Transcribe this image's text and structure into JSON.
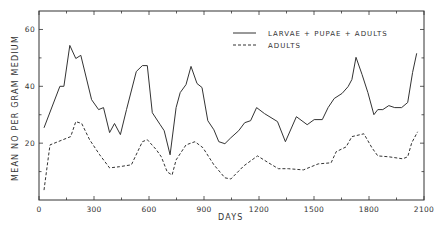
{
  "chart_data": {
    "type": "line",
    "title": "",
    "xlabel": "DAYS",
    "ylabel": "MEAN NO PER GRAM MEDIUM",
    "xlim": [
      0,
      2100
    ],
    "ylim": [
      0,
      66.5
    ],
    "xticks": [
      0,
      300,
      600,
      900,
      1200,
      1500,
      1800,
      2100
    ],
    "xtick_labels": [
      "0",
      "300",
      "600",
      "900",
      "1200",
      "1500",
      "1800",
      "2100"
    ],
    "xminor_step": 150,
    "yticks": [
      20,
      40,
      60
    ],
    "ytick_labels": [
      "20",
      "40",
      "60"
    ],
    "yminor_step": 10,
    "grid": false,
    "legend_position": "upper right",
    "series": [
      {
        "name": "LARVAE + PUPAE + ADULTS",
        "style": "solid",
        "color": "#333333",
        "x": [
          27,
          114,
          136,
          168,
          201,
          228,
          287,
          325,
          352,
          385,
          412,
          444,
          477,
          531,
          564,
          591,
          618,
          661,
          683,
          715,
          748,
          770,
          802,
          829,
          862,
          889,
          921,
          954,
          981,
          1014,
          1046,
          1089,
          1122,
          1154,
          1187,
          1230,
          1301,
          1344,
          1404,
          1463,
          1501,
          1545,
          1577,
          1610,
          1653,
          1686,
          1707,
          1729,
          1762,
          1794,
          1827,
          1848,
          1875,
          1908,
          1940,
          1978,
          2011,
          2038,
          2060
        ],
        "values": [
          25.4,
          40,
          40,
          54.4,
          49.8,
          50.9,
          35.3,
          31.8,
          32.5,
          23.7,
          26.9,
          23,
          31.8,
          45.2,
          47.3,
          47.3,
          30.7,
          26.5,
          24.4,
          15.9,
          32.5,
          37.8,
          40.6,
          47,
          41,
          39.6,
          27.9,
          24.7,
          20.5,
          19.8,
          21.9,
          24.4,
          27.2,
          27.9,
          32.5,
          30.4,
          27.6,
          20.5,
          29.3,
          26.5,
          28.3,
          28.3,
          32.5,
          35.7,
          37.5,
          39.9,
          42.4,
          50.2,
          44.2,
          37.8,
          30,
          31.8,
          31.8,
          33.2,
          32.5,
          32.5,
          34.3,
          44.9,
          51.6
        ]
      },
      {
        "name": "ADULTS",
        "style": "dashed",
        "color": "#333333",
        "x": [
          27,
          60,
          173,
          201,
          233,
          276,
          331,
          385,
          439,
          504,
          564,
          591,
          640,
          667,
          699,
          726,
          748,
          802,
          851,
          894,
          954,
          1014,
          1046,
          1117,
          1192,
          1252,
          1306,
          1360,
          1442,
          1523,
          1593,
          1621,
          1675,
          1707,
          1772,
          1816,
          1848,
          1908,
          1984,
          2011,
          2033,
          2065
        ],
        "values": [
          3.5,
          19.4,
          22.3,
          27.6,
          26.9,
          21.2,
          15.9,
          11.3,
          11.7,
          12.4,
          20.5,
          21.2,
          17.7,
          15.2,
          9.9,
          8.8,
          14.1,
          19.4,
          20.5,
          18.4,
          12.4,
          7.8,
          7.4,
          12,
          15.5,
          13.1,
          11,
          11,
          10.6,
          12.7,
          13.1,
          17,
          18.7,
          22.3,
          23.3,
          18.4,
          15.5,
          15.2,
          14.5,
          15.2,
          20.1,
          24
        ]
      }
    ]
  },
  "legend": {
    "items": [
      {
        "label": "LARVAE  +  PUPAE  +  ADULTS",
        "style": "solid"
      },
      {
        "label": "ADULTS",
        "style": "dashed"
      }
    ]
  },
  "axes": {
    "x_title": "DAYS",
    "y_title": "MEAN   NO   PER   GRAM   MEDIUM"
  },
  "colors": {
    "ink": "#333333",
    "background": "#ffffff"
  }
}
